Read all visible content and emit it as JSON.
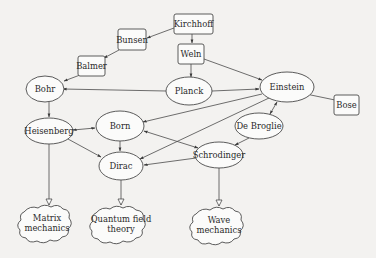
{
  "diagram": {
    "title": "",
    "nodes": [
      {
        "id": "kirchhoff",
        "label": "Kirchhoff",
        "shape": "box",
        "cx": 193,
        "cy": 24,
        "w": 40,
        "h": 20
      },
      {
        "id": "bunsen",
        "label": "Bunsen",
        "shape": "box",
        "cx": 132,
        "cy": 40,
        "w": 29,
        "h": 21
      },
      {
        "id": "weln",
        "label": "Weln",
        "shape": "box",
        "cx": 191,
        "cy": 54,
        "w": 26,
        "h": 20
      },
      {
        "id": "balmer",
        "label": "Balmer",
        "shape": "box",
        "cx": 92,
        "cy": 66,
        "w": 28,
        "h": 20
      },
      {
        "id": "bohr",
        "label": "Bohr",
        "shape": "ellipse",
        "cx": 44,
        "cy": 89,
        "rx": 18,
        "ry": 13
      },
      {
        "id": "planck",
        "label": "Planck",
        "shape": "ellipse",
        "cx": 189,
        "cy": 91,
        "rx": 23,
        "ry": 14
      },
      {
        "id": "einstein",
        "label": "Einstein",
        "shape": "ellipse",
        "cx": 287,
        "cy": 87,
        "rx": 27,
        "ry": 15
      },
      {
        "id": "bose",
        "label": "Bose",
        "shape": "box",
        "cx": 347,
        "cy": 104,
        "w": 25,
        "h": 20
      },
      {
        "id": "heisenberg",
        "label": "Heisenberg",
        "shape": "ellipse",
        "cx": 49,
        "cy": 131,
        "rx": 23,
        "ry": 13
      },
      {
        "id": "born",
        "label": "Born",
        "shape": "ellipse",
        "cx": 120,
        "cy": 126,
        "rx": 24,
        "ry": 15
      },
      {
        "id": "debroglie",
        "label": "De Broglie",
        "shape": "ellipse",
        "cx": 259,
        "cy": 126,
        "rx": 24,
        "ry": 13
      },
      {
        "id": "schrodinger",
        "label": "Schrodinger",
        "shape": "ellipse",
        "cx": 219,
        "cy": 155,
        "rx": 24,
        "ry": 13
      },
      {
        "id": "dirac",
        "label": "Dirac",
        "shape": "ellipse",
        "cx": 121,
        "cy": 166,
        "rx": 22,
        "ry": 14
      },
      {
        "id": "matrix",
        "label_lines": [
          "Matrix",
          "mechanics"
        ],
        "shape": "cloud",
        "cx": 47,
        "cy": 223
      },
      {
        "id": "qft",
        "label_lines": [
          "Quantum field",
          "theory"
        ],
        "shape": "cloud",
        "cx": 121,
        "cy": 224
      },
      {
        "id": "wave",
        "label_lines": [
          "Wave",
          "mechanics"
        ],
        "shape": "cloud",
        "cx": 219,
        "cy": 225
      }
    ],
    "edges": [
      {
        "from": "kirchhoff",
        "to": "bunsen",
        "arrow": "end"
      },
      {
        "from": "kirchhoff",
        "to": "weln",
        "arrow": "end"
      },
      {
        "from": "bunsen",
        "to": "balmer",
        "arrow": "end"
      },
      {
        "from": "balmer",
        "to": "bohr",
        "arrow": "end"
      },
      {
        "from": "weln",
        "to": "planck",
        "arrow": "end"
      },
      {
        "from": "weln",
        "to": "einstein",
        "arrow": "end"
      },
      {
        "from": "planck",
        "to": "bohr",
        "arrow": "end"
      },
      {
        "from": "planck",
        "to": "einstein",
        "arrow": "end"
      },
      {
        "from": "bose",
        "to": "einstein",
        "arrow": "end"
      },
      {
        "from": "einstein",
        "to": "born",
        "arrow": "end"
      },
      {
        "from": "einstein",
        "to": "dirac",
        "arrow": "end"
      },
      {
        "from": "einstein",
        "to": "debroglie",
        "arrow": "both"
      },
      {
        "from": "bohr",
        "to": "heisenberg",
        "arrow": "end"
      },
      {
        "from": "heisenberg",
        "to": "born",
        "arrow": "both"
      },
      {
        "from": "heisenberg",
        "to": "dirac",
        "arrow": "end"
      },
      {
        "from": "born",
        "to": "dirac",
        "arrow": "end"
      },
      {
        "from": "born",
        "to": "schrodinger",
        "arrow": "both"
      },
      {
        "from": "debroglie",
        "to": "schrodinger",
        "arrow": "end"
      },
      {
        "from": "schrodinger",
        "to": "dirac",
        "arrow": "end"
      },
      {
        "from": "heisenberg",
        "to": "matrix",
        "arrow": "hollow"
      },
      {
        "from": "dirac",
        "to": "qft",
        "arrow": "hollow"
      },
      {
        "from": "schrodinger",
        "to": "wave",
        "arrow": "hollow"
      }
    ]
  },
  "labels": {
    "kirchhoff": "Kirchhoff",
    "bunsen": "Bunsen",
    "weln": "Weln",
    "balmer": "Balmer",
    "bohr": "Bohr",
    "planck": "Planck",
    "einstein": "Einstein",
    "bose": "Bose",
    "heisenberg": "Heisenberg",
    "born": "Born",
    "debroglie": "De Broglie",
    "schrodinger": "Schrodinger",
    "dirac": "Dirac",
    "matrix_1": "Matrix",
    "matrix_2": "mechanics",
    "qft_1": "Quantum field",
    "qft_2": "theory",
    "wave_1": "Wave",
    "wave_2": "mechanics"
  }
}
